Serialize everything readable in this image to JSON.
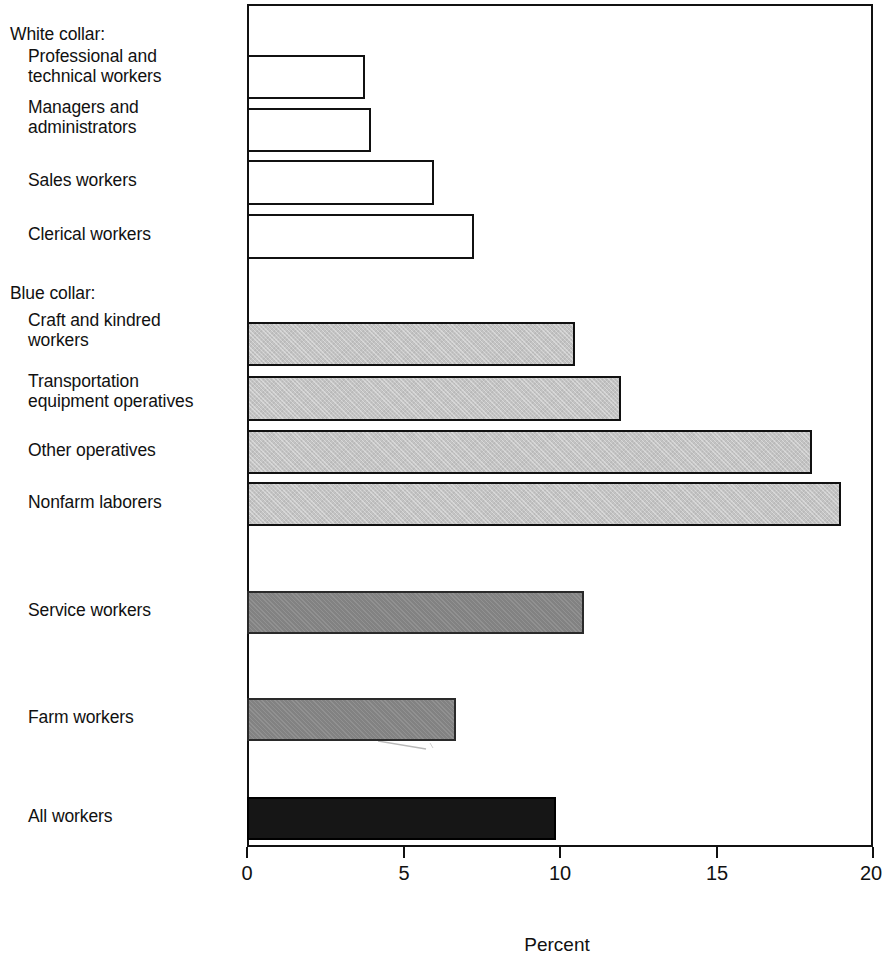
{
  "chart_data": {
    "type": "bar",
    "orientation": "horizontal",
    "title": "",
    "xlabel": "Percent",
    "ylabel": "",
    "xlim": [
      0,
      20
    ],
    "xticks": [
      0,
      5,
      10,
      15,
      20
    ],
    "xtick_labels": [
      "0",
      "5",
      "10",
      "15",
      "20"
    ],
    "grid": false,
    "legend": false,
    "group_headings": [
      "White collar:",
      "Blue collar:"
    ],
    "categories": [
      "Professional and\ntechnical workers",
      "Managers and\nadministrators",
      "Sales workers",
      "Clerical workers",
      "Craft and kindred\nworkers",
      "Transportation\nequipment operatives",
      "Other operatives",
      "Nonfarm laborers",
      "Service workers",
      "Farm workers",
      "All workers"
    ],
    "values": [
      3.7,
      3.9,
      5.9,
      7.2,
      10.4,
      11.9,
      18.0,
      18.9,
      10.7,
      6.6,
      9.8
    ],
    "series": [
      {
        "name": "Percent",
        "values": [
          3.7,
          3.9,
          5.9,
          7.2,
          10.4,
          11.9,
          18.0,
          18.9,
          10.7,
          6.6,
          9.8
        ]
      }
    ],
    "bar_styles": [
      "white",
      "white",
      "white",
      "white",
      "light-gray",
      "light-gray",
      "light-gray",
      "light-gray",
      "medium-gray",
      "medium-gray",
      "black"
    ],
    "colors": {
      "white_collar": "#ffffff",
      "blue_collar": "#c3c3c3",
      "service_farm": "#828282",
      "all_workers": "#161616",
      "outline": "#111111"
    }
  },
  "labels": {
    "white_collar_heading": "White collar:",
    "professional": "Professional and\ntechnical workers",
    "managers": "Managers and\nadministrators",
    "sales": "Sales workers",
    "clerical": "Clerical workers",
    "blue_collar_heading": "Blue collar:",
    "craft": "Craft and kindred\nworkers",
    "transportation": "Transportation\nequipment operatives",
    "other_operatives": "Other operatives",
    "nonfarm": "Nonfarm laborers",
    "service": "Service workers",
    "farm": "Farm workers",
    "all_workers": "All workers"
  },
  "axis": {
    "title": "Percent",
    "ticks": [
      "0",
      "5",
      "10",
      "15",
      "20"
    ]
  }
}
